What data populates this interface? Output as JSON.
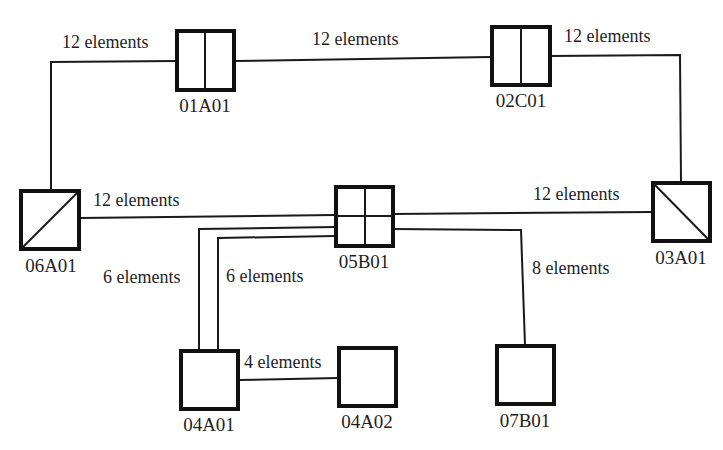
{
  "diagram": {
    "nodes": {
      "n01A01": {
        "id": "01A01",
        "type": "split-vertical"
      },
      "n02C01": {
        "id": "02C01",
        "type": "split-vertical"
      },
      "n03A01": {
        "id": "03A01",
        "type": "diagonal-down"
      },
      "n04A01": {
        "id": "04A01",
        "type": "plain"
      },
      "n04A02": {
        "id": "04A02",
        "type": "plain"
      },
      "n05B01": {
        "id": "05B01",
        "type": "quad-grid"
      },
      "n06A01": {
        "id": "06A01",
        "type": "diagonal-up"
      },
      "n07B01": {
        "id": "07B01",
        "type": "plain"
      }
    },
    "links": {
      "l06_01": {
        "from": "06A01",
        "to": "01A01",
        "label": "12 elements"
      },
      "l01_02": {
        "from": "01A01",
        "to": "02C01",
        "label": "12 elements"
      },
      "l02_03": {
        "from": "02C01",
        "to": "03A01",
        "label": "12 elements"
      },
      "l06_05": {
        "from": "06A01",
        "to": "05B01",
        "label": "12 elements"
      },
      "l05_03": {
        "from": "05B01",
        "to": "03A01",
        "label": "12 elements"
      },
      "l05_04a": {
        "from": "05B01",
        "to": "04A01",
        "label": "6 elements"
      },
      "l05_04b": {
        "from": "05B01",
        "to": "04A01",
        "label": "6 elements"
      },
      "l05_07": {
        "from": "05B01",
        "to": "07B01",
        "label": "8 elements"
      },
      "l04_04": {
        "from": "04A01",
        "to": "04A02",
        "label": "4 elements"
      }
    }
  }
}
